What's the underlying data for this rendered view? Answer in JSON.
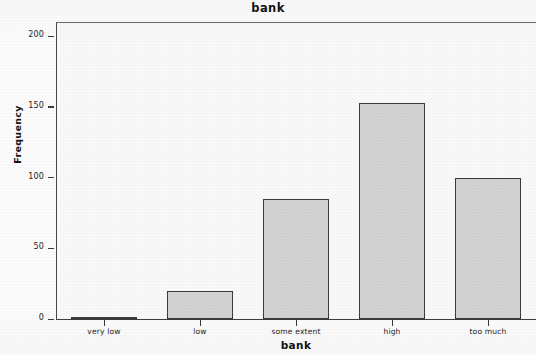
{
  "chart_data": {
    "type": "bar",
    "title": "bank",
    "xlabel": "bank",
    "ylabel": "Frequency",
    "categories": [
      "very low",
      "low",
      "some extent",
      "high",
      "too much"
    ],
    "values": [
      1,
      20,
      85,
      153,
      100
    ],
    "ylim": [
      0,
      210
    ],
    "y_ticks": [
      0,
      50,
      100,
      150,
      200
    ],
    "y_tick_labels": [
      "0",
      "50",
      "100",
      "150",
      "200"
    ],
    "grid": false,
    "legend": "none",
    "bar_fill_color": "#d4d4d4",
    "bar_border_color": "#3a3a3a",
    "plot_background_color": "#fafafa",
    "axis_color": "#3d3d3d",
    "text_color": "#1c1c1c"
  }
}
